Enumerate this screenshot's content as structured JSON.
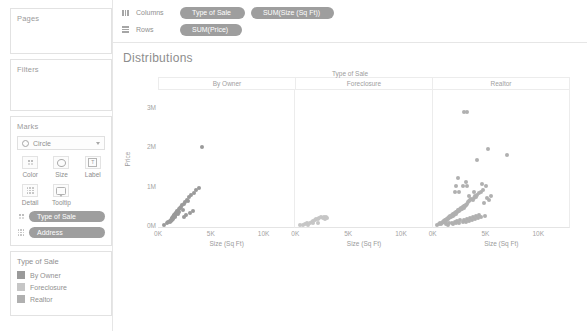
{
  "sidebar": {
    "pages": {
      "title": "Pages"
    },
    "filters": {
      "title": "Filters"
    },
    "marks": {
      "title": "Marks",
      "mark_type": "Circle",
      "buttons": [
        {
          "label": "Color",
          "icon": "color-icon"
        },
        {
          "label": "Size",
          "icon": "size-icon"
        },
        {
          "label": "Label",
          "icon": "label-icon"
        },
        {
          "label": "Detail",
          "icon": "detail-icon"
        },
        {
          "label": "Tooltip",
          "icon": "tooltip-icon"
        }
      ],
      "pills": [
        {
          "label": "Type of Sale",
          "icon": "color-icon"
        },
        {
          "label": "Address",
          "icon": "detail-icon"
        }
      ]
    },
    "legend": {
      "title": "Type of Sale",
      "items": [
        {
          "label": "By Owner",
          "color": "#9a9a9a"
        },
        {
          "label": "Foreclosure",
          "color": "#c6c6c6"
        },
        {
          "label": "Realtor",
          "color": "#b0b0b0"
        }
      ]
    }
  },
  "shelves": {
    "columns": {
      "label": "Columns",
      "pills": [
        "Type of Sale",
        "SUM(Size (Sq Ft))"
      ]
    },
    "rows": {
      "label": "Rows",
      "pills": [
        "SUM(Price)"
      ]
    }
  },
  "chart_data": {
    "type": "scatter",
    "title": "Distributions",
    "field_header": "Type of Sale",
    "xlabel": "Size (Sq Ft)",
    "ylabel": "Price",
    "xlim": [
      0,
      13000
    ],
    "ylim": [
      0,
      3500000
    ],
    "xticks": [
      0,
      5000,
      10000
    ],
    "xticklabels": [
      "0K",
      "5K",
      "10K"
    ],
    "yticks": [
      0,
      1000000,
      2000000,
      3000000
    ],
    "yticklabels": [
      "0M",
      "1M",
      "2M",
      "3M"
    ],
    "grid": false,
    "legend_position": "left-sidebar",
    "mark_color": "#9d9d9d",
    "mark_size": 4,
    "panes": [
      {
        "name": "By Owner",
        "color": "#9a9a9a",
        "points": [
          [
            600,
            60000
          ],
          [
            900,
            95000
          ],
          [
            1000,
            120000
          ],
          [
            1100,
            140000
          ],
          [
            1150,
            160000
          ],
          [
            1200,
            150000
          ],
          [
            1250,
            175000
          ],
          [
            1300,
            190000
          ],
          [
            1320,
            205000
          ],
          [
            1350,
            215000
          ],
          [
            1380,
            230000
          ],
          [
            1400,
            200000
          ],
          [
            1420,
            245000
          ],
          [
            1450,
            260000
          ],
          [
            1470,
            225000
          ],
          [
            1500,
            270000
          ],
          [
            1520,
            285000
          ],
          [
            1550,
            300000
          ],
          [
            1580,
            250000
          ],
          [
            1600,
            310000
          ],
          [
            1620,
            330000
          ],
          [
            1650,
            290000
          ],
          [
            1680,
            350000
          ],
          [
            1700,
            365000
          ],
          [
            1750,
            320000
          ],
          [
            1800,
            380000
          ],
          [
            1850,
            400000
          ],
          [
            1900,
            345000
          ],
          [
            1950,
            420000
          ],
          [
            2000,
            455000
          ],
          [
            2050,
            390000
          ],
          [
            2100,
            480000
          ],
          [
            2200,
            520000
          ],
          [
            2300,
            560000
          ],
          [
            2400,
            430000
          ],
          [
            2500,
            600000
          ],
          [
            2600,
            640000
          ],
          [
            2800,
            700000
          ],
          [
            2900,
            660000
          ],
          [
            3000,
            760000
          ],
          [
            3100,
            820000
          ],
          [
            3400,
            880000
          ],
          [
            3600,
            950000
          ],
          [
            3900,
            1000000
          ],
          [
            2700,
            300000
          ],
          [
            3050,
            360000
          ],
          [
            3300,
            420000
          ],
          [
            2450,
            250000
          ],
          [
            4200,
            2050000
          ]
        ]
      },
      {
        "name": "Foreclosure",
        "color": "#c6c6c6",
        "points": [
          [
            450,
            40000
          ],
          [
            700,
            55000
          ],
          [
            900,
            70000
          ],
          [
            1100,
            90000
          ],
          [
            1250,
            60000
          ],
          [
            1400,
            110000
          ],
          [
            1550,
            130000
          ],
          [
            1700,
            155000
          ],
          [
            1850,
            175000
          ],
          [
            2000,
            200000
          ],
          [
            2150,
            215000
          ],
          [
            2300,
            230000
          ],
          [
            2450,
            245000
          ],
          [
            2600,
            225000
          ],
          [
            2750,
            250000
          ],
          [
            2900,
            265000
          ],
          [
            3050,
            240000
          ],
          [
            2200,
            95000
          ],
          [
            1650,
            105000
          ],
          [
            2850,
            200000
          ]
        ]
      },
      {
        "name": "Realtor",
        "color": "#b0b0b0",
        "points": [
          [
            400,
            50000
          ],
          [
            600,
            70000
          ],
          [
            700,
            90000
          ],
          [
            800,
            85000
          ],
          [
            900,
            110000
          ],
          [
            950,
            130000
          ],
          [
            1000,
            120000
          ],
          [
            1050,
            145000
          ],
          [
            1100,
            155000
          ],
          [
            1150,
            140000
          ],
          [
            1200,
            170000
          ],
          [
            1250,
            185000
          ],
          [
            1300,
            165000
          ],
          [
            1350,
            200000
          ],
          [
            1400,
            215000
          ],
          [
            1450,
            195000
          ],
          [
            1500,
            230000
          ],
          [
            1550,
            245000
          ],
          [
            1600,
            225000
          ],
          [
            1650,
            260000
          ],
          [
            1700,
            275000
          ],
          [
            1750,
            255000
          ],
          [
            1800,
            290000
          ],
          [
            1850,
            305000
          ],
          [
            1900,
            285000
          ],
          [
            1950,
            320000
          ],
          [
            2000,
            335000
          ],
          [
            2050,
            315000
          ],
          [
            2100,
            350000
          ],
          [
            2150,
            365000
          ],
          [
            2200,
            345000
          ],
          [
            2250,
            380000
          ],
          [
            2300,
            395000
          ],
          [
            2350,
            375000
          ],
          [
            2400,
            410000
          ],
          [
            2450,
            425000
          ],
          [
            2500,
            405000
          ],
          [
            2550,
            440000
          ],
          [
            2600,
            455000
          ],
          [
            2650,
            435000
          ],
          [
            2700,
            470000
          ],
          [
            2750,
            485000
          ],
          [
            2800,
            465000
          ],
          [
            2850,
            500000
          ],
          [
            2900,
            515000
          ],
          [
            2950,
            495000
          ],
          [
            3000,
            530000
          ],
          [
            3050,
            545000
          ],
          [
            3100,
            525000
          ],
          [
            3150,
            560000
          ],
          [
            3200,
            575000
          ],
          [
            3300,
            600000
          ],
          [
            3400,
            630000
          ],
          [
            3500,
            660000
          ],
          [
            3600,
            690000
          ],
          [
            3700,
            720000
          ],
          [
            3800,
            700000
          ],
          [
            3900,
            750000
          ],
          [
            4000,
            780000
          ],
          [
            4100,
            760000
          ],
          [
            4200,
            820000
          ],
          [
            4400,
            870000
          ],
          [
            4600,
            900000
          ],
          [
            4800,
            940000
          ],
          [
            1300,
            80000
          ],
          [
            1550,
            95000
          ],
          [
            1800,
            110000
          ],
          [
            2100,
            130000
          ],
          [
            2350,
            150000
          ],
          [
            2650,
            175000
          ],
          [
            2950,
            190000
          ],
          [
            3250,
            210000
          ],
          [
            3550,
            235000
          ],
          [
            3850,
            260000
          ],
          [
            4150,
            285000
          ],
          [
            4450,
            310000
          ],
          [
            1450,
            60000
          ],
          [
            1900,
            75000
          ],
          [
            2250,
            90000
          ],
          [
            2550,
            105000
          ],
          [
            2850,
            120000
          ],
          [
            3150,
            140000
          ],
          [
            3450,
            160000
          ],
          [
            3750,
            180000
          ],
          [
            4050,
            205000
          ],
          [
            4350,
            225000
          ],
          [
            4650,
            250000
          ],
          [
            4950,
            275000
          ],
          [
            2200,
            1050000
          ],
          [
            2900,
            1050000
          ],
          [
            2100,
            900000
          ],
          [
            2500,
            900000
          ],
          [
            2400,
            1250000
          ],
          [
            3150,
            1150000
          ],
          [
            3300,
            1050000
          ],
          [
            3500,
            800000
          ],
          [
            3900,
            900000
          ],
          [
            4200,
            1700000
          ],
          [
            4700,
            1100000
          ],
          [
            5050,
            1050000
          ],
          [
            5300,
            2000000
          ],
          [
            3000,
            2950000
          ],
          [
            3250,
            2950000
          ],
          [
            7100,
            1850000
          ],
          [
            5200,
            750000
          ],
          [
            5600,
            800000
          ],
          [
            4900,
            620000
          ],
          [
            5400,
            680000
          ]
        ]
      }
    ]
  }
}
